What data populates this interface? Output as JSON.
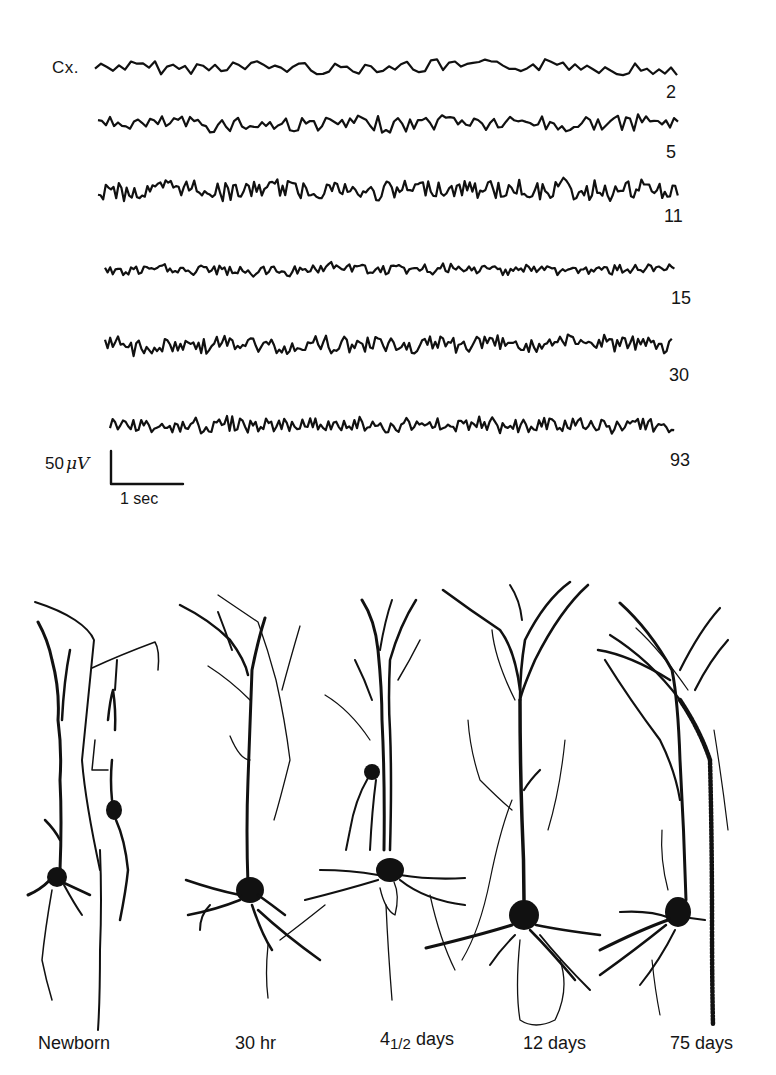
{
  "figure": {
    "panel_a": {
      "channel_label": "Cx.",
      "traces": [
        {
          "age_days": "2",
          "y": 68,
          "x0": 95,
          "x1": 678,
          "amp": 9,
          "freq": "low"
        },
        {
          "age_days": "5",
          "y": 125,
          "x0": 98,
          "x1": 680,
          "amp": 11,
          "freq": "med"
        },
        {
          "age_days": "11",
          "y": 190,
          "x0": 98,
          "x1": 678,
          "amp": 13,
          "freq": "high"
        },
        {
          "age_days": "15",
          "y": 270,
          "x0": 105,
          "x1": 676,
          "amp": 7,
          "freq": "high"
        },
        {
          "age_days": "30",
          "y": 345,
          "x0": 105,
          "x1": 674,
          "amp": 11,
          "freq": "high"
        },
        {
          "age_days": "93",
          "y": 425,
          "x0": 110,
          "x1": 675,
          "amp": 10,
          "freq": "high"
        }
      ],
      "scale_bar": {
        "voltage_label": "50 μV",
        "voltage_prefix": "50",
        "voltage_unit": "μV",
        "time_label": "1 sec"
      }
    },
    "panel_b": {
      "neurons": [
        {
          "label": "Newborn"
        },
        {
          "label": "30 hr"
        },
        {
          "label_num": "4",
          "label_frac": "1/2",
          "label_unit": "days"
        },
        {
          "label": "12 days"
        },
        {
          "label": "75 days"
        }
      ]
    },
    "colors": {
      "ink": "#111111",
      "background": "#ffffff"
    }
  }
}
